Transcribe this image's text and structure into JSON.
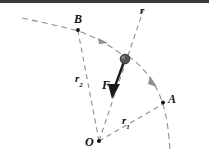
{
  "figure": {
    "background_color": "#ffffff",
    "top_band_color": "#3a3a3a",
    "stroke_color": "#8a8a8a",
    "ink_color": "#111111",
    "particle_color": "#4d4d4d",
    "width": 209,
    "height": 157
  },
  "labels": {
    "origin": "O",
    "point_a": "A",
    "point_b": "B",
    "radial_line": "r",
    "radius_1": "r",
    "radius_1_sub": "1",
    "radius_2": "r",
    "radius_2_sub": "2",
    "force": "F"
  },
  "geometry": {
    "origin_point": {
      "x": 99,
      "y": 141
    },
    "point_a": {
      "x": 163,
      "y": 104
    },
    "point_b": {
      "x": 78,
      "y": 30
    },
    "particle": {
      "x": 125,
      "y": 59,
      "radius": 4.6
    },
    "force_vector": {
      "from_x": 125,
      "from_y": 59,
      "to_x": 112,
      "to_y": 95
    },
    "radial_line_r": {
      "from_x": 99,
      "from_y": 141,
      "to_x": 143,
      "to_y": 10
    },
    "line_to_a": {
      "from_x": 99,
      "from_y": 141,
      "to_x": 163,
      "to_y": 104
    },
    "line_to_b": {
      "from_x": 99,
      "from_y": 141,
      "to_x": 78,
      "to_y": 30
    }
  },
  "label_positions": {
    "origin": {
      "x": 86,
      "y": 137
    },
    "point_a": {
      "x": 168,
      "y": 93
    },
    "point_b": {
      "x": 74,
      "y": 13
    },
    "radial_line": {
      "x": 139,
      "y": 6
    },
    "radius_1": {
      "x": 122,
      "y": 116
    },
    "radius_2": {
      "x": 75,
      "y": 74
    },
    "force": {
      "x": 104,
      "y": 80
    }
  }
}
